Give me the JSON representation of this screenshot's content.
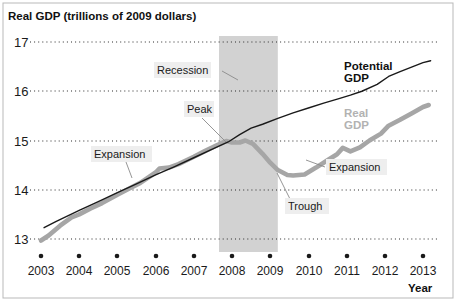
{
  "chart_data": {
    "type": "line",
    "title": "Real GDP (trillions of 2009 dollars)",
    "xlabel": "Year",
    "ylabel": "Real GDP (trillions of 2009 dollars)",
    "xlim": [
      2002.75,
      2013.3
    ],
    "ylim": [
      12.78,
      17.1
    ],
    "grid": true,
    "grid_style": "dotted-horizontal",
    "legend": "inline-series-labels",
    "yticks": [
      13,
      14,
      15,
      16,
      17
    ],
    "ytick_labels": [
      "13",
      "14",
      "15",
      "16",
      "17"
    ],
    "xticks": [
      2003,
      2004,
      2005,
      2006,
      2007,
      2008,
      2009,
      2010,
      2011,
      2012,
      2013
    ],
    "xtick_labels": [
      "2003",
      "2004",
      "2005",
      "2006",
      "2007",
      "2008",
      "2009",
      "2010",
      "2011",
      "2012",
      "2013"
    ],
    "series": [
      {
        "name": "Potential GDP",
        "color": "#1a1a1a",
        "width": 1.4,
        "x": [
          2003.08,
          2003.4,
          2004.0,
          2004.5,
          2005.0,
          2005.5,
          2006.0,
          2006.5,
          2007.0,
          2007.5,
          2007.9,
          2008.2,
          2008.5,
          2008.8,
          2009.2,
          2009.6,
          2010.0,
          2010.4,
          2010.8,
          2011.1,
          2011.4,
          2011.8,
          2012.1,
          2012.4,
          2012.7,
          2013.0,
          2013.2
        ],
        "values": [
          13.23,
          13.36,
          13.58,
          13.76,
          13.94,
          14.12,
          14.3,
          14.47,
          14.65,
          14.83,
          14.97,
          15.12,
          15.25,
          15.33,
          15.45,
          15.56,
          15.66,
          15.76,
          15.85,
          15.92,
          16.0,
          16.14,
          16.3,
          16.4,
          16.49,
          16.58,
          16.62
        ]
      },
      {
        "name": "Real GDP",
        "color": "#a6a6a6",
        "width": 4.6,
        "x": [
          2003.0,
          2003.2,
          2003.5,
          2003.8,
          2004.0,
          2004.3,
          2004.6,
          2005.0,
          2005.3,
          2005.6,
          2006.0,
          2006.1,
          2006.35,
          2006.6,
          2007.0,
          2007.3,
          2007.6,
          2007.85,
          2008.0,
          2008.2,
          2008.35,
          2008.55,
          2008.8,
          2009.0,
          2009.2,
          2009.45,
          2009.6,
          2009.9,
          2010.2,
          2010.5,
          2010.75,
          2010.9,
          2011.1,
          2011.35,
          2011.6,
          2011.9,
          2012.1,
          2012.4,
          2012.7,
          2013.0,
          2013.15
        ],
        "values": [
          12.97,
          13.07,
          13.27,
          13.44,
          13.5,
          13.62,
          13.73,
          13.9,
          14.02,
          14.14,
          14.35,
          14.43,
          14.45,
          14.52,
          14.67,
          14.79,
          14.9,
          14.99,
          14.96,
          14.96,
          15.0,
          14.93,
          14.73,
          14.55,
          14.4,
          14.3,
          14.29,
          14.31,
          14.45,
          14.6,
          14.72,
          14.85,
          14.78,
          14.86,
          15.0,
          15.14,
          15.3,
          15.42,
          15.55,
          15.68,
          15.72
        ]
      }
    ],
    "shaded_regions": [
      {
        "label": "Recession",
        "from": 2007.66,
        "to": 2009.2,
        "color": "#d2d2d2"
      }
    ],
    "annotations": [
      {
        "text": "Recession",
        "x": 2007.0,
        "y": 16.42
      },
      {
        "text": "Peak",
        "x": 2007.15,
        "y": 15.55
      },
      {
        "text": "Expansion",
        "x": 2004.6,
        "y": 14.62,
        "id": "expansion-left"
      },
      {
        "text": "Trough",
        "x": 2010.15,
        "y": 13.78,
        "id": "trough"
      },
      {
        "text": "Expansion",
        "x": 2010.95,
        "y": 14.71,
        "id": "expansion-right"
      }
    ],
    "series_labels": [
      {
        "text_line1": "Potential",
        "text_line2": "GDP",
        "color": "#111111"
      },
      {
        "text_line1": "Real",
        "text_line2": "GDP",
        "color": "#b2b2b2"
      }
    ]
  }
}
